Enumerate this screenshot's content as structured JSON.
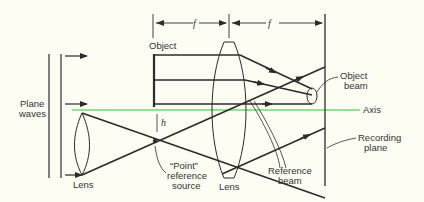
{
  "figure": {
    "labels": {
      "object": "Object",
      "object_beam_1": "Object",
      "object_beam_2": "beam",
      "axis": "Axis",
      "plane_waves_1": "Plane",
      "plane_waves_2": "waves",
      "lens_left": "Lens",
      "lens_center": "Lens",
      "point_ref_1": "“Point”",
      "point_ref_2": "reference",
      "point_ref_3": "source",
      "reference_beam_1": "Reference",
      "reference_beam_2": "beam",
      "recording_plane_1": "Recording",
      "recording_plane_2": "plane",
      "focal_1": "f",
      "focal_2": "f",
      "height": "h"
    },
    "colors": {
      "background": "#fdfdf3",
      "lines": "#2a2a2a",
      "axis": "#6fd86f"
    }
  }
}
